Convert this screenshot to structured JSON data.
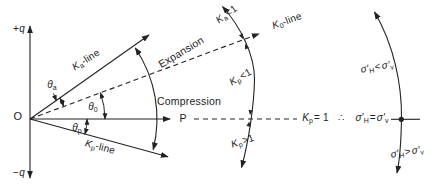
{
  "colors": {
    "ink": "#222222",
    "background": "#ffffff"
  },
  "axis": {
    "plus_q": {
      "sign": "+",
      "var": "q"
    },
    "minus_q": {
      "sign": "−",
      "var": "q"
    },
    "origin": "O",
    "p": "P"
  },
  "lines": {
    "ka": {
      "base": "K",
      "sub": "a",
      "rest": "-line"
    },
    "k0": {
      "base": "K",
      "sub": "0",
      "rest": "-line"
    },
    "kp": {
      "base": "K",
      "sub": "p",
      "rest": "-line"
    }
  },
  "zones": {
    "expansion": "Expansion",
    "compression": "Compression"
  },
  "angles": {
    "theta_a": {
      "base": "θ",
      "sub": "a"
    },
    "theta_0": {
      "base": "θ",
      "sub": "0"
    },
    "theta_p": {
      "base": "θ",
      "sub": "p"
    }
  },
  "coefficients": {
    "ka_lt_1": {
      "base": "K",
      "sub": "a",
      "rel": "<1"
    },
    "kp_lt_1": {
      "base": "K",
      "sub": "p",
      "rel": "<1"
    },
    "kp_gt_1": {
      "base": "K",
      "sub": "p",
      "rel": ">1"
    },
    "kp_eq_1": {
      "base": "K",
      "sub": "p",
      "rel": "= 1"
    }
  },
  "conclusion": {
    "therefore": "∴",
    "equal": {
      "lhs": "σ′",
      "lhs_sub": "H",
      "op": "=",
      "rhs": "σ′",
      "rhs_sub": "v"
    }
  },
  "stress_states": {
    "less": {
      "lhs": "σ′",
      "lhs_sub": "H",
      "op": "<",
      "rhs": "σ′",
      "rhs_sub": "v"
    },
    "greater": {
      "lhs": "σ′",
      "lhs_sub": "H",
      "op": ">",
      "rhs": "σ′",
      "rhs_sub": "v"
    }
  }
}
